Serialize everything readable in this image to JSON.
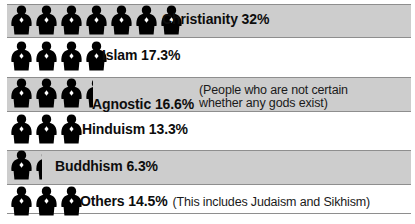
{
  "chart_data": {
    "type": "bar",
    "title": "",
    "subtitle": "",
    "xlabel": "",
    "ylabel": "",
    "orientation": "horizontal",
    "unit": "percent",
    "pictogram": {
      "icon": "person-icon",
      "value_per_icon": 5,
      "note": "Each figure represents approximately 5% of the world population"
    },
    "legend": [],
    "grid": false,
    "categories": [
      "Christianity",
      "Islam",
      "Agnostic",
      "Hinduism",
      "Buddhism",
      "Others"
    ],
    "values": [
      32,
      17.3,
      16.6,
      13.3,
      6.3,
      14.5
    ],
    "annotations": [
      "(People who are not certain whether any gods exist)",
      "(This includes Judaism and Sikhism)"
    ]
  },
  "colors": {
    "band": "#cdcdcd",
    "band_border": "#8e8e8e",
    "figure": "#000000",
    "text": "#0d0d0d",
    "background": "#ffffff"
  },
  "rows": [
    {
      "key": "christianity",
      "label": "Christianity 32%",
      "name": "Christianity",
      "percent": "32%",
      "note": "",
      "note_line1": "",
      "note_line2": "",
      "figures_full": 7,
      "figures_partial": 0,
      "shaded": true
    },
    {
      "key": "islam",
      "label": "Islam 17.3%",
      "name": "Islam",
      "percent": "17.3%",
      "note": "",
      "note_line1": "",
      "note_line2": "",
      "figures_full": 4,
      "figures_partial": 0,
      "shaded": false
    },
    {
      "key": "agnostic",
      "label": "Agnostic 16.6%",
      "name": "Agnostic",
      "percent": "16.6%",
      "note": "(People who are not certain whether any gods exist)",
      "note_line1": "(People who are not certain",
      "note_line2": " whether any gods exist)",
      "figures_full": 3,
      "figures_partial": 0.35,
      "shaded": true
    },
    {
      "key": "hinduism",
      "label": "Hinduism 13.3%",
      "name": "Hinduism",
      "percent": "13.3%",
      "note": "",
      "note_line1": "",
      "note_line2": "",
      "figures_full": 3,
      "figures_partial": 0,
      "shaded": false
    },
    {
      "key": "buddhism",
      "label": "Buddhism 6.3%",
      "name": "Buddhism",
      "percent": "6.3%",
      "note": "",
      "note_line1": "",
      "note_line2": "",
      "figures_full": 1,
      "figures_partial": 0.3,
      "shaded": true
    },
    {
      "key": "others",
      "label": "Others 14.5%",
      "name": "Others",
      "percent": "14.5%",
      "note": "(This includes Judaism and Sikhism)",
      "note_line1": "(This includes Judaism and Sikhism)",
      "note_line2": "",
      "figures_full": 3,
      "figures_partial": 0,
      "shaded": false
    }
  ]
}
